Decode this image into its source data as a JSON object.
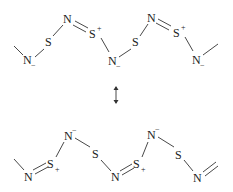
{
  "diagram": {
    "type": "resonance-structures",
    "arrow": "resonance-double-headed-arrow",
    "top": {
      "atoms": [
        {
          "id": "t1",
          "label": "N",
          "charge": "−",
          "x": 28,
          "y": 64
        },
        {
          "id": "t2",
          "label": "S",
          "charge": "",
          "x": 49,
          "y": 46
        },
        {
          "id": "t3",
          "label": "N",
          "charge": "",
          "x": 68,
          "y": 23
        },
        {
          "id": "t4",
          "label": "S",
          "charge": "+",
          "x": 94,
          "y": 36
        },
        {
          "id": "t5",
          "label": "N",
          "charge": "−",
          "x": 113,
          "y": 64
        },
        {
          "id": "t6",
          "label": "S",
          "charge": "",
          "x": 136,
          "y": 46
        },
        {
          "id": "t7",
          "label": "N",
          "charge": "",
          "x": 152,
          "y": 22
        },
        {
          "id": "t8",
          "label": "S",
          "charge": "+",
          "x": 178,
          "y": 35
        },
        {
          "id": "t9",
          "label": "N",
          "charge": "−",
          "x": 197,
          "y": 63
        }
      ]
    },
    "bottom": {
      "atoms": [
        {
          "id": "b1",
          "label": "N",
          "charge": "",
          "x": 28,
          "y": 180
        },
        {
          "id": "b2",
          "label": "S",
          "charge": "+",
          "x": 51,
          "y": 167
        },
        {
          "id": "b3",
          "label": "N",
          "charge": "−",
          "x": 69,
          "y": 139
        },
        {
          "id": "b4",
          "label": "S",
          "charge": "",
          "x": 96,
          "y": 158
        },
        {
          "id": "b5",
          "label": "N",
          "charge": "",
          "x": 115,
          "y": 180
        },
        {
          "id": "b6",
          "label": "S",
          "charge": "+",
          "x": 137,
          "y": 167
        },
        {
          "id": "b7",
          "label": "N",
          "charge": "−",
          "x": 152,
          "y": 138
        },
        {
          "id": "b8",
          "label": "S",
          "charge": "",
          "x": 179,
          "y": 158
        },
        {
          "id": "b9",
          "label": "N",
          "charge": "",
          "x": 197,
          "y": 181
        }
      ]
    }
  }
}
